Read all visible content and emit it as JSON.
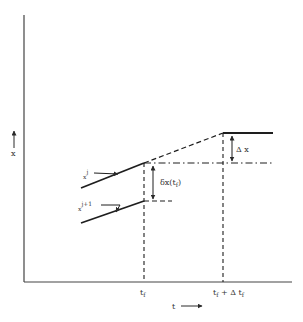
{
  "diagram": {
    "type": "trajectory-perturbation",
    "axes": {
      "x_axis_label": "t",
      "y_axis_label": "x"
    },
    "curves": {
      "upper_label_base": "x",
      "upper_label_sup": "j",
      "lower_label_base": "x",
      "lower_label_sup": "j+1"
    },
    "annotations": {
      "delta_x_tf_base": "δx(t",
      "delta_x_tf_sub": "f",
      "delta_x_tf_close": ")",
      "capital_delta_x": "Δ x"
    },
    "ticks": {
      "tf_base": "t",
      "tf_sub": "f",
      "tf_plus_base": "t",
      "tf_plus_sub": "f",
      "tf_plus_mid": " + Δ t",
      "tf_plus_sub2": "f"
    },
    "colors": {
      "ink": "#2a2a2a",
      "background": "#ffffff"
    }
  }
}
